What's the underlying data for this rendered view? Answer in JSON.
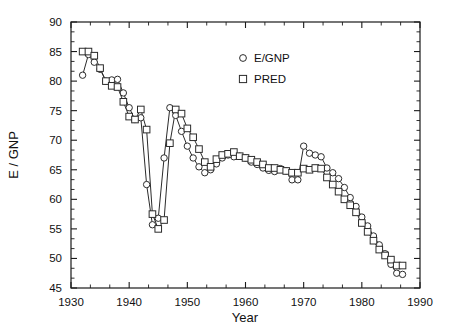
{
  "chart_data": {
    "type": "line",
    "title": "",
    "subtitle": "",
    "xlabel": "Year",
    "ylabel": "E / GNP",
    "xlim": [
      1930,
      1990
    ],
    "ylim": [
      45,
      90
    ],
    "xticks": [
      1930,
      1940,
      1950,
      1960,
      1970,
      1980,
      1990
    ],
    "yticks": [
      45,
      50,
      55,
      60,
      65,
      70,
      75,
      80,
      85,
      90
    ],
    "xticklabels": [
      "1930",
      "1940",
      "1950",
      "1960",
      "1970",
      "1980",
      "1990"
    ],
    "yticklabels": [
      "45",
      "50",
      "55",
      "60",
      "65",
      "70",
      "75",
      "80",
      "85",
      "90"
    ],
    "minor_x_ticks_per_interval": 2,
    "minor_y_ticks_per_interval": 2,
    "grid": false,
    "legend_position": "top-center-right",
    "legend": [
      {
        "name": "E/GNP",
        "marker": "circle"
      },
      {
        "name": "PRED",
        "marker": "square"
      }
    ],
    "x": [
      1932,
      1933,
      1934,
      1935,
      1936,
      1937,
      1938,
      1939,
      1940,
      1941,
      1942,
      1943,
      1944,
      1945,
      1946,
      1947,
      1948,
      1949,
      1950,
      1951,
      1952,
      1953,
      1954,
      1955,
      1956,
      1957,
      1958,
      1959,
      1960,
      1961,
      1962,
      1963,
      1964,
      1965,
      1966,
      1967,
      1968,
      1969,
      1970,
      1971,
      1972,
      1973,
      1974,
      1975,
      1976,
      1977,
      1978,
      1979,
      1980,
      1981,
      1982,
      1983,
      1984,
      1985,
      1986,
      1987
    ],
    "series": [
      {
        "name": "E/GNP",
        "marker": "circle",
        "values": [
          81.0,
          84.5,
          83.2,
          82.0,
          80.0,
          80.2,
          80.3,
          78.0,
          75.5,
          73.5,
          73.8,
          62.5,
          55.7,
          56.8,
          67.0,
          75.5,
          74.2,
          71.5,
          69.0,
          67.0,
          65.5,
          64.5,
          65.0,
          66.0,
          67.0,
          67.5,
          67.2,
          67.3,
          67.0,
          66.3,
          65.9,
          65.3,
          64.9,
          64.7,
          65.2,
          64.8,
          63.3,
          63.3,
          69.0,
          67.8,
          67.5,
          67.2,
          65.3,
          64.5,
          63.5,
          62.0,
          60.3,
          58.8,
          57.0,
          55.5,
          53.8,
          52.3,
          50.8,
          49.0,
          47.5,
          47.3
        ]
      },
      {
        "name": "PRED",
        "marker": "square",
        "values": [
          85.0,
          85.0,
          84.3,
          82.2,
          80.0,
          79.2,
          79.0,
          76.5,
          74.0,
          73.5,
          75.2,
          71.8,
          57.5,
          55.0,
          56.5,
          69.5,
          75.2,
          74.5,
          72.0,
          70.5,
          68.5,
          66.3,
          65.5,
          66.8,
          67.5,
          67.7,
          68.0,
          67.3,
          67.0,
          66.7,
          66.3,
          65.9,
          65.3,
          65.3,
          65.0,
          64.8,
          64.5,
          64.5,
          65.2,
          65.0,
          65.3,
          65.2,
          63.7,
          62.5,
          61.3,
          60.0,
          59.0,
          57.8,
          56.0,
          54.5,
          53.0,
          51.5,
          50.5,
          49.8,
          48.8,
          48.8
        ]
      }
    ]
  },
  "axes": {
    "xlabel": "Year",
    "ylabel": "E / GNP"
  }
}
